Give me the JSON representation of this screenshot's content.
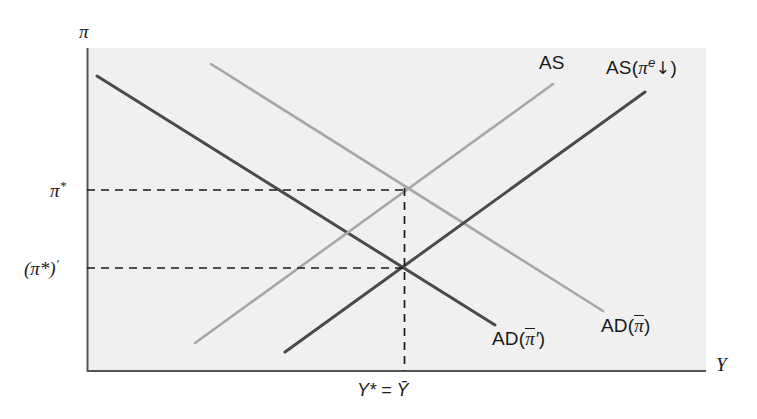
{
  "figure": {
    "type": "economics-ad-as-diagram",
    "background_color": "#ffffff",
    "plot_background_color": "#f0f0f0",
    "axis_color": "#555555",
    "dark_curve_color": "#4a4a4a",
    "light_curve_color": "#a8a8a8",
    "dashed_color": "#1a1a1a"
  },
  "axes": {
    "y_axis_label": "π",
    "x_axis_label": "Y",
    "plot_left_px": 87,
    "plot_right_px": 706,
    "plot_top_px": 48,
    "plot_bottom_px": 371
  },
  "y_ticks": [
    {
      "label_main": "π",
      "label_sup": "*",
      "y_px": 190,
      "name": "pi-star"
    },
    {
      "label_main": "(π*)",
      "label_sup": "′",
      "y_px": 268,
      "name": "pi-star-prime"
    }
  ],
  "x_ticks": [
    {
      "label": "Y* = Ȳ",
      "x_px": 404,
      "name": "y-star-equals-y-bar"
    }
  ],
  "curves": [
    {
      "name": "ad-original",
      "label_prefix": "AD(",
      "label_bar": "π",
      "label_suffix": ")",
      "style": "light",
      "slope": "negative",
      "x1": 211,
      "y1": 64,
      "x2": 603,
      "y2": 311,
      "label_x": 601,
      "label_y": 325
    },
    {
      "name": "ad-shifted",
      "label_prefix": "AD(",
      "label_bar": "π",
      "label_prime": "′",
      "label_suffix": ")",
      "style": "dark",
      "slope": "negative",
      "x1": 97,
      "y1": 76,
      "x2": 495,
      "y2": 325,
      "label_x": 492,
      "label_y": 338
    },
    {
      "name": "as-original",
      "label": "AS",
      "style": "light",
      "slope": "positive",
      "x1": 195,
      "y1": 343,
      "x2": 553,
      "y2": 84,
      "label_x": 539,
      "label_y": 63
    },
    {
      "name": "as-shifted",
      "label_prefix": "AS(",
      "label_pi": "π",
      "label_sup": "e",
      "label_arrow": "↓",
      "label_suffix": ")",
      "style": "dark",
      "slope": "positive",
      "x1": 285,
      "y1": 352,
      "x2": 645,
      "y2": 92,
      "label_x": 606,
      "label_y": 66
    }
  ],
  "equilibria": [
    {
      "name": "initial-equilibrium",
      "x_px": 404,
      "y_px": 190
    },
    {
      "name": "new-equilibrium",
      "x_px": 404,
      "y_px": 268
    }
  ],
  "guides": [
    {
      "name": "guide-horizontal-pi-star",
      "orientation": "horizontal",
      "y_px": 190,
      "x_from": 87,
      "x_to": 404
    },
    {
      "name": "guide-horizontal-pi-star-prime",
      "orientation": "horizontal",
      "y_px": 268,
      "x_from": 87,
      "x_to": 404
    },
    {
      "name": "guide-vertical-y-star",
      "orientation": "vertical",
      "x_px": 404,
      "y_from": 190,
      "y_to": 371
    }
  ]
}
